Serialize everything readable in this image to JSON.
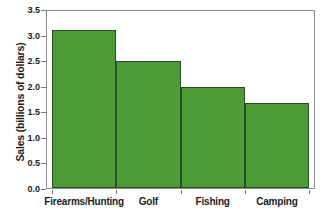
{
  "chart_data": {
    "type": "bar",
    "title": "",
    "xlabel": "",
    "ylabel": "Sales (billions of dollars)",
    "categories": [
      "Firearms/Hunting",
      "Golf",
      "Fishing",
      "Camping"
    ],
    "values": [
      3.08,
      2.48,
      1.97,
      1.66
    ],
    "ylim": [
      0.0,
      3.5
    ],
    "ytick_labels": [
      "0.0",
      "0.5",
      "1.0",
      "1.5",
      "2.0",
      "2.5",
      "3.0",
      "3.5"
    ],
    "ytick_values": [
      0.0,
      0.5,
      1.0,
      1.5,
      2.0,
      2.5,
      3.0,
      3.5
    ],
    "grid": false,
    "legend": null,
    "bar_color": "#4d9b36",
    "bar_edge_color": "#2b4f22",
    "frame_color": "#8c8c8c",
    "background_color": "#ffffff"
  }
}
